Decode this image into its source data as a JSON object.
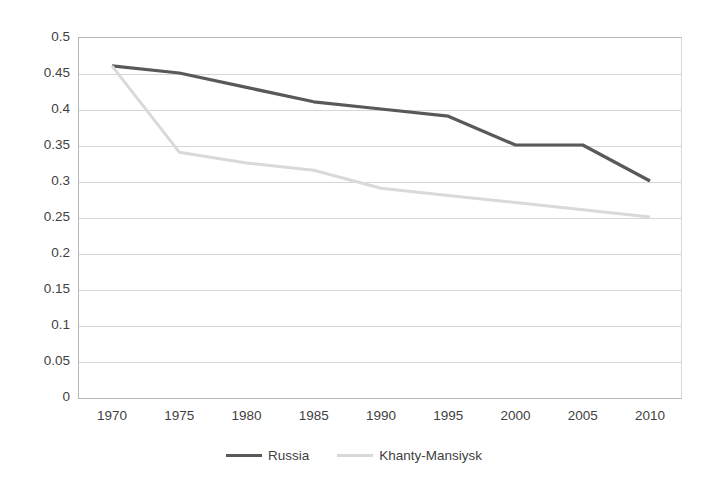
{
  "chart_data": {
    "type": "line",
    "title": "",
    "subtitle": "",
    "xlabel": "",
    "ylabel": "",
    "categories": [
      1970,
      1975,
      1980,
      1985,
      1990,
      1995,
      2000,
      2005,
      2010
    ],
    "x_tick_labels": [
      "1970",
      "1975",
      "1980",
      "1985",
      "1990",
      "1995",
      "2000",
      "2005",
      "2010"
    ],
    "y_tick_labels": [
      "0.5",
      "0.45",
      "0.4",
      "0.35",
      "0.3",
      "0.25",
      "0.2",
      "0.15",
      "0.1",
      "0.05",
      "0"
    ],
    "y_tick_values": [
      0.5,
      0.45,
      0.4,
      0.35,
      0.3,
      0.25,
      0.2,
      0.15,
      0.1,
      0.05,
      0
    ],
    "xlim": [
      1970,
      2010
    ],
    "ylim": [
      0,
      0.5
    ],
    "grid": "horizontal",
    "legend_position": "bottom-center",
    "series": [
      {
        "name": "Russia",
        "color": "#595959",
        "width": 3.2,
        "values": [
          0.46,
          0.45,
          0.43,
          0.41,
          0.4,
          0.39,
          0.35,
          0.35,
          0.3
        ]
      },
      {
        "name": "Khanty-Mansiysk",
        "color": "#d9d9d9",
        "width": 3.0,
        "values": [
          0.46,
          0.34,
          0.325,
          0.315,
          0.29,
          0.28,
          0.27,
          0.26,
          0.25
        ]
      }
    ]
  },
  "legend": {
    "items": [
      {
        "label": "Russia",
        "color": "#595959"
      },
      {
        "label": "Khanty-Mansiysk",
        "color": "#d9d9d9"
      }
    ]
  },
  "style": {
    "background": "#ffffff",
    "text_color": "#3f3f3f",
    "gridline_color": "#d6d6d6",
    "axis_color": "#b5b5b5"
  }
}
